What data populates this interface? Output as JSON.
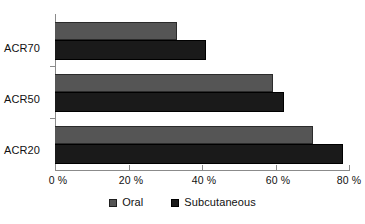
{
  "chart_data": {
    "type": "bar",
    "orientation": "horizontal",
    "title": "",
    "subtitle": "",
    "xlabel": "",
    "ylabel": "",
    "categories": [
      "ACR70",
      "ACR50",
      "ACR20"
    ],
    "series": [
      {
        "name": "Oral",
        "color": "#555555",
        "values": [
          33,
          59,
          70
        ]
      },
      {
        "name": "Subcutaneous",
        "color": "#1a1a1a",
        "values": [
          41,
          62,
          78
        ]
      }
    ],
    "xlim": [
      0,
      80
    ],
    "xticks": [
      0,
      20,
      40,
      60,
      80
    ],
    "xtick_labels": [
      "0 %",
      "20 %",
      "40 %",
      "60 %",
      "80 %"
    ],
    "unit": "%",
    "grid": false,
    "legend_position": "bottom",
    "legend_entries": [
      "Oral",
      "Subcutaneous"
    ],
    "annotations": []
  },
  "axis": {
    "ticks": [
      {
        "label": "0 %",
        "value": 0
      },
      {
        "label": "20 %",
        "value": 20
      },
      {
        "label": "40 %",
        "value": 40
      },
      {
        "label": "60 %",
        "value": 60
      },
      {
        "label": "80 %",
        "value": 80
      }
    ]
  },
  "categories": [
    {
      "label": "ACR70"
    },
    {
      "label": "ACR50"
    },
    {
      "label": "ACR20"
    }
  ],
  "legend": {
    "items": [
      {
        "label": "Oral",
        "swatch": "oral-swatch"
      },
      {
        "label": "Subcutaneous",
        "swatch": "subcutaneous-swatch"
      }
    ]
  },
  "colors": {
    "oral": "#555555",
    "subcutaneous": "#1a1a1a",
    "axis": "#8b8b8b",
    "background": "#ffffff",
    "text": "#111111"
  }
}
